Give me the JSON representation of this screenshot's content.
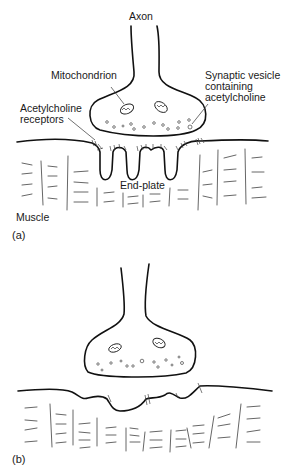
{
  "cutoff_caption": "...y of the neuromuscular junction in myasthenia gravis...",
  "panel_a": {
    "label": "(a)",
    "labels": {
      "axon": "Axon",
      "mitochondrion": "Mitochondrion",
      "synaptic_vesicle_line1": "Synaptic vesicle",
      "synaptic_vesicle_line2": "containing",
      "synaptic_vesicle_line3": "acetylcholine",
      "receptors_line1": "Acetylcholine",
      "receptors_line2": "receptors",
      "end_plate": "End-plate",
      "muscle": "Muscle"
    }
  },
  "panel_b": {
    "label": "(b)"
  }
}
